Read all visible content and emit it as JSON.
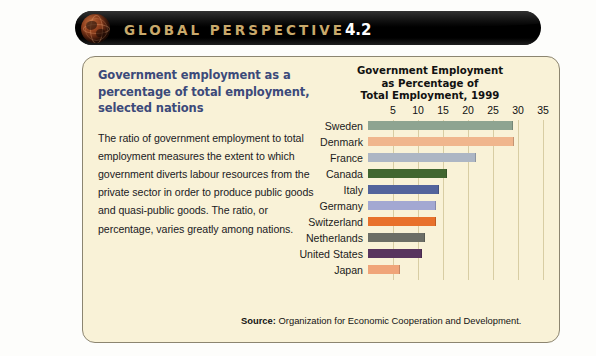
{
  "banner": {
    "label": "GLOBAL PERSPECTIVE",
    "number": "4.2",
    "icon": "globe-icon",
    "text_color": "#c9a96b",
    "background": "#000000"
  },
  "panel": {
    "background": "#f9f2d7",
    "border_color": "#8c8570"
  },
  "left": {
    "heading": "Government employment as a percentage of total employment, selected nations",
    "heading_color": "#3c4a7a",
    "body": "The ratio of government employment to total employment measures the extent to which government diverts labour resources from the private sector in order to produce public goods and quasi-public goods. The ratio, or percentage, varies greatly among nations."
  },
  "chart_data": {
    "type": "bar",
    "orientation": "horizontal",
    "title_lines": [
      "Government Employment",
      "as Percentage of",
      "Total Employment, 1999"
    ],
    "xlabel": "",
    "ylabel": "",
    "xlim": [
      0,
      37
    ],
    "ticks": [
      5,
      10,
      15,
      20,
      25,
      30,
      35
    ],
    "grid": true,
    "legend": "none",
    "categories": [
      "Sweden",
      "Denmark",
      "France",
      "Canada",
      "Italy",
      "Germany",
      "Switzerland",
      "Netherlands",
      "United States",
      "Japan"
    ],
    "values": [
      28.8,
      29.0,
      21.4,
      15.6,
      14.0,
      13.4,
      13.4,
      11.2,
      10.6,
      6.2
    ],
    "colors": [
      "#8ea491",
      "#f0b68d",
      "#adb6c4",
      "#41662f",
      "#53649c",
      "#a3a8d2",
      "#e8712b",
      "#6c6e66",
      "#58345e",
      "#f0a579"
    ]
  },
  "source": {
    "label": "Source:",
    "text": "Organization for Economic Cooperation and Development."
  }
}
